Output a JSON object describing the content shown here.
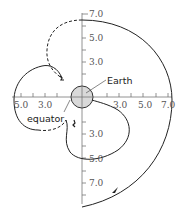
{
  "diagram": {
    "labels": {
      "earth": "Earth",
      "equator": "equator"
    },
    "axis_labels": {
      "vertical_top": [
        "7.0",
        "5.0",
        "3.0"
      ],
      "vertical_bottom": [
        "3.0",
        "5.0",
        "7.0"
      ],
      "horizontal_left": [
        "5.0",
        "3.0"
      ],
      "horizontal_right": [
        "3.0",
        "5.0",
        "7.0"
      ]
    },
    "colors": {
      "line": "#222222",
      "axis": "#777777",
      "earth_fill": "#d9d9d9",
      "text": "#555555"
    }
  }
}
